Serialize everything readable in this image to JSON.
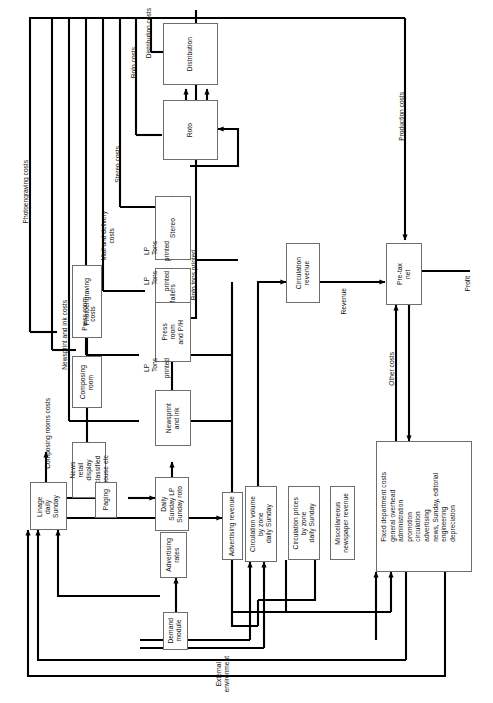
{
  "diagram": {
    "type": "flowchart",
    "orientation": "rotated-90-ccw-text",
    "colors": {
      "line": "#000000",
      "box_border": "#6e6e6e",
      "background": "#ffffff",
      "text": "#111111"
    }
  },
  "nodes": {
    "distribution": {
      "label": "Distribution"
    },
    "roto": {
      "label": "Roto"
    },
    "stereo": {
      "label": "Stereo"
    },
    "mailers": {
      "label": "Mailers"
    },
    "press_room": {
      "label": "Press\nroom\nand P/H"
    },
    "newsprint_and_ink": {
      "label": "Newsprint\nand ink"
    },
    "photoengraving": {
      "label": "Photoengraving"
    },
    "composing_room": {
      "label": "Composing\nroom"
    },
    "news_types": {
      "label": "News\nretail\ndisplay\nclassified\nhouse etc"
    },
    "linage": {
      "label": "Linage\ndaily\nSunday"
    },
    "paging": {
      "label": "Paging"
    },
    "daily_sunday": {
      "label": "Daily\nSunday LP\nSunday roto"
    },
    "advertising_rates": {
      "label": "Advertising\nrates"
    },
    "demand_module": {
      "label": "Demand\nmodule"
    },
    "advertising_revenue": {
      "label": "Advertising revenue"
    },
    "circulation_volume": {
      "label": "Circulation volume\nby zone\ndaily Sunday"
    },
    "circulation_prices": {
      "label": "Circulation prices\nby zone\ndaily Sunday"
    },
    "misc_revenue": {
      "label": "Miscellaneous\nnewspaper revenue"
    },
    "circulation_revenue": {
      "label": "Circulation\nrevenue"
    },
    "pretax_net": {
      "label": "Pre-tax\nnet"
    },
    "fixed_department_costs": {
      "label": "Fixed department costs\ngeneral overhead\nadministration\npromotion\ncirculation\nadvertising\nnews, Sunday, editorial\nengineering\ndepreciation"
    }
  },
  "edge_labels": {
    "photoengraving_costs": "Photoengraving costs",
    "composing_rooms_costs": "Composing rooms costs",
    "newsprint_and_ink_costs": "Newsprint and ink costs",
    "press_room_costs": "Press room\ncosts",
    "mail_and_delivery_costs": "Mail and delivery\ncosts",
    "stereo_costs": "Stereo costs",
    "roto_costs": "Roto costs",
    "distribution_costs": "Distribution costs",
    "production_costs": "Production costs",
    "other_costs": "Other costs",
    "revenue": "Revenue",
    "profit": "Profit",
    "roto_tons_printed": "Roto tons printed",
    "lp_tons_printed_1": "LP\nTons",
    "lp_tons_printed_1b": "printed",
    "lp_tons_printed_2": "LP\nTons",
    "lp_tons_printed_2b": "printed",
    "lp_tons_printed_3": "LP\nTons",
    "lp_tons_printed_3b": "printed",
    "external_environment": "External\nenvironment"
  }
}
